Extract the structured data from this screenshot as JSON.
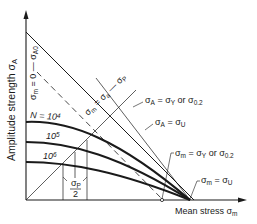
{
  "axes": {
    "y_label": "Amplitude strength σ",
    "y_label_sub": "A",
    "x_label": "Mean stress σ",
    "x_label_sub": "m"
  },
  "labels": {
    "sigma_m_zero": "σm = 0 — σA0",
    "sigma_m_zero_parts": {
      "a": "σ",
      "a_sub": "m",
      "b": " = 0 — σ",
      "b_sub": "A0"
    },
    "diag": {
      "a": "σ",
      "a_sub": "m",
      "b": " = σ",
      "b_sub": "a",
      "c": " — σ",
      "c_sub": "P"
    },
    "yield_amp": {
      "a": "σ",
      "a_sub": "A",
      "b": " = σ",
      "b_sub": "Y",
      "c": " or σ",
      "c_sub": "0.2"
    },
    "ult_amp": {
      "a": "σ",
      "a_sub": "A",
      "b": " = σ",
      "b_sub": "U"
    },
    "yield_mean": {
      "a": "σ",
      "a_sub": "m",
      "b": " = σ",
      "b_sub": "Y",
      "c": " or σ",
      "c_sub": "0.2"
    },
    "ult_mean": {
      "a": "σ",
      "a_sub": "m",
      "b": " = σ",
      "b_sub": "U"
    },
    "sigma_p_half": {
      "num": "σ",
      "num_sub": "P",
      "den": "2"
    }
  },
  "curves": [
    {
      "label": "N = 10",
      "exp": "4"
    },
    {
      "label": "10",
      "exp": "5"
    },
    {
      "label": "10",
      "exp": "6"
    }
  ]
}
